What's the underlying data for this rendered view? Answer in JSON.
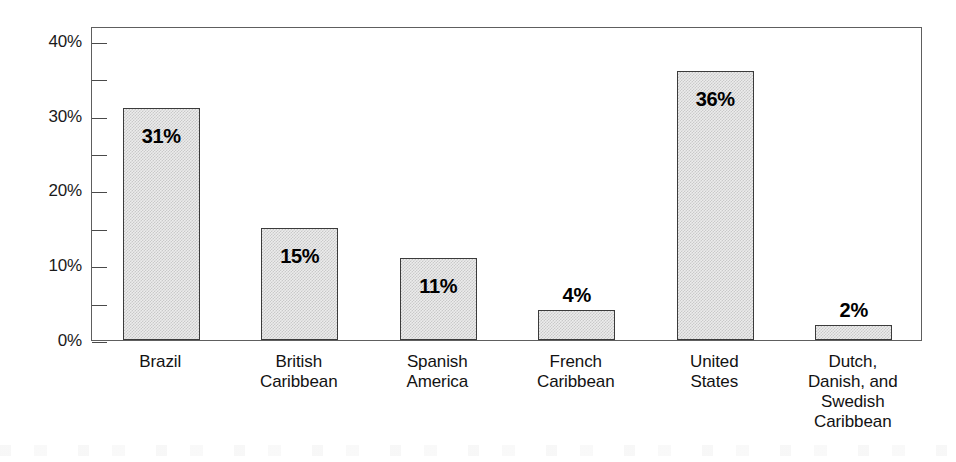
{
  "chart_data": {
    "type": "bar",
    "title": "",
    "subtitle": "",
    "xlabel": "",
    "ylabel": "",
    "categories": [
      "Brazil",
      "British Caribbean",
      "Spanish America",
      "French Caribbean",
      "United States",
      "Dutch, Danish, and Swedish Caribbean"
    ],
    "values": [
      31,
      15,
      11,
      4,
      36,
      2
    ],
    "data_labels": [
      "31%",
      "15%",
      "11%",
      "4%",
      "36%",
      "2%"
    ],
    "ylim": [
      0,
      42
    ],
    "y_major_ticks": [
      0,
      10,
      20,
      30,
      40
    ],
    "y_minor_ticks": [
      5,
      15,
      25,
      35
    ],
    "y_tick_labels": [
      "0%",
      "10%",
      "20%",
      "30%",
      "40%"
    ],
    "grid": false,
    "legend": false,
    "legend_position": "none",
    "bar_fill": "#ececec",
    "bar_edge": "#3b3b3b",
    "axis_color": "#5e5e5e",
    "text_color": "#121212"
  },
  "axis": {
    "y_labels": [
      {
        "text": "40%",
        "value": 40
      },
      {
        "text": "30%",
        "value": 30
      },
      {
        "text": "20%",
        "value": 20
      },
      {
        "text": "10%",
        "value": 10
      },
      {
        "text": "0%",
        "value": 0
      }
    ]
  },
  "bars": [
    {
      "label_lines": [
        "Brazil"
      ],
      "value": 31,
      "value_label": "31%",
      "label_placement": "inside"
    },
    {
      "label_lines": [
        "British",
        "Caribbean"
      ],
      "value": 15,
      "value_label": "15%",
      "label_placement": "inside"
    },
    {
      "label_lines": [
        "Spanish",
        "America"
      ],
      "value": 11,
      "value_label": "11%",
      "label_placement": "inside"
    },
    {
      "label_lines": [
        "French",
        "Caribbean"
      ],
      "value": 4,
      "value_label": "4%",
      "label_placement": "above"
    },
    {
      "label_lines": [
        "United",
        "States"
      ],
      "value": 36,
      "value_label": "36%",
      "label_placement": "inside"
    },
    {
      "label_lines": [
        "Dutch,",
        "Danish, and",
        "Swedish",
        "Caribbean"
      ],
      "value": 2,
      "value_label": "2%",
      "label_placement": "above"
    }
  ]
}
